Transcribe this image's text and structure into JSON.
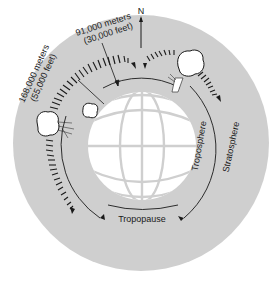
{
  "diagram": {
    "compass": {
      "label": "N"
    },
    "labels": {
      "high_altitude": {
        "line1": "168,000 meters",
        "line2": "(55,000 feet)"
      },
      "low_altitude": {
        "line1": "91,000 meters",
        "line2": "(30,000 feet)"
      },
      "tropopause": "Tropopause",
      "troposphere": "Troposphere",
      "stratosphere": "Stratosphere"
    },
    "colors": {
      "atmosphere": "#cfcfcf",
      "earth": "#ffffff",
      "grid": "#cfcfcf",
      "ink": "#1a1a1a"
    }
  }
}
